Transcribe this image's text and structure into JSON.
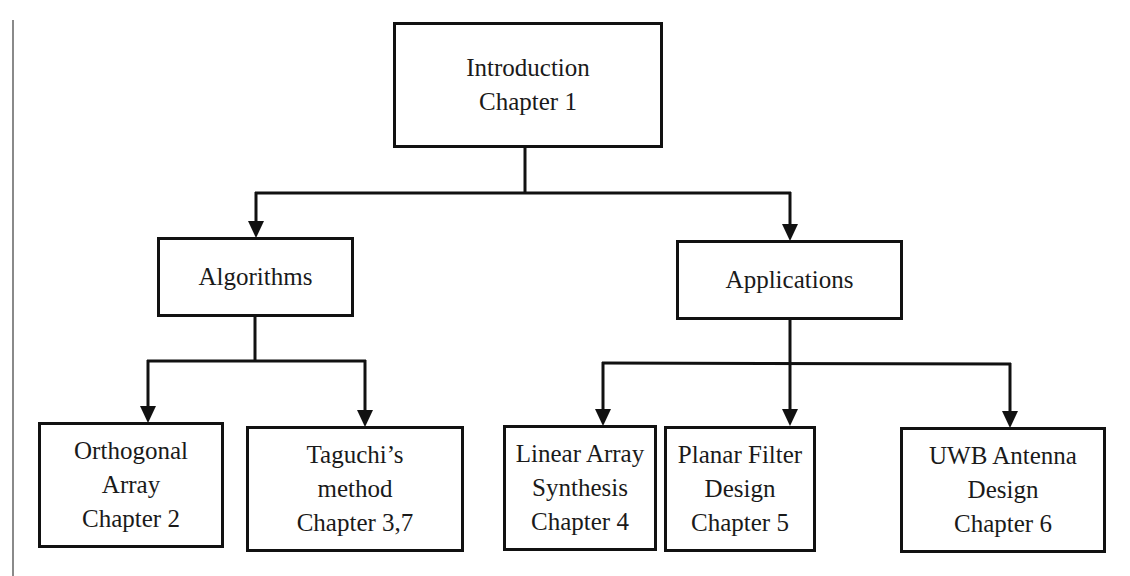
{
  "diagram": {
    "type": "hierarchy",
    "root": {
      "id": "introduction",
      "lines": [
        "Introduction",
        "Chapter 1"
      ]
    },
    "branches": [
      {
        "id": "algorithms",
        "lines": [
          "Algorithms"
        ],
        "children": [
          {
            "id": "orthogonal-array",
            "lines": [
              "Orthogonal",
              "Array",
              "Chapter 2"
            ]
          },
          {
            "id": "taguchi-method",
            "lines": [
              "Taguchi’s",
              "method",
              "Chapter 3,7"
            ]
          }
        ]
      },
      {
        "id": "applications",
        "lines": [
          "Applications"
        ],
        "children": [
          {
            "id": "linear-array-synthesis",
            "lines": [
              "Linear Array",
              "Synthesis",
              "Chapter 4"
            ]
          },
          {
            "id": "planar-filter-design",
            "lines": [
              "Planar Filter",
              "Design",
              "Chapter 5"
            ]
          },
          {
            "id": "uwb-antenna-design",
            "lines": [
              "UWB Antenna",
              "Design",
              "Chapter 6"
            ]
          }
        ]
      }
    ],
    "colors": {
      "stroke": "#111111",
      "background": "#ffffff",
      "margin_rule": "#8a8a8a"
    }
  }
}
